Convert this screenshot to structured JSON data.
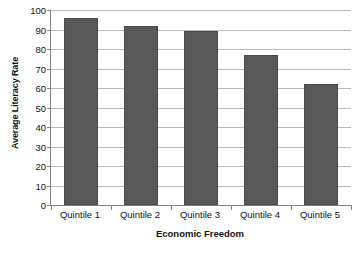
{
  "chart_data": {
    "type": "bar",
    "title": "",
    "subtitle": "",
    "categories": [
      "Quintile 1",
      "Quintile 2",
      "Quintile 3",
      "Quintile 4",
      "Quintile 5"
    ],
    "values": [
      96,
      92,
      89,
      77,
      62
    ],
    "xlabel": "Economic Freedom",
    "ylabel": "Average Literacy Rate",
    "ylim": [
      0,
      100
    ],
    "ytick_step": 10,
    "yticks": [
      0,
      10,
      20,
      30,
      40,
      50,
      60,
      70,
      80,
      90,
      100
    ],
    "ytick_labels": [
      "0",
      "10",
      "20",
      "30",
      "40",
      "50",
      "60",
      "70",
      "80",
      "90",
      "100"
    ],
    "grid": "horizontal",
    "legend": "none",
    "bar_color": "#595959",
    "gridline_color": "#b9b9b9",
    "axis_color": "#808080",
    "background_color": "#ffffff",
    "annotations": []
  }
}
